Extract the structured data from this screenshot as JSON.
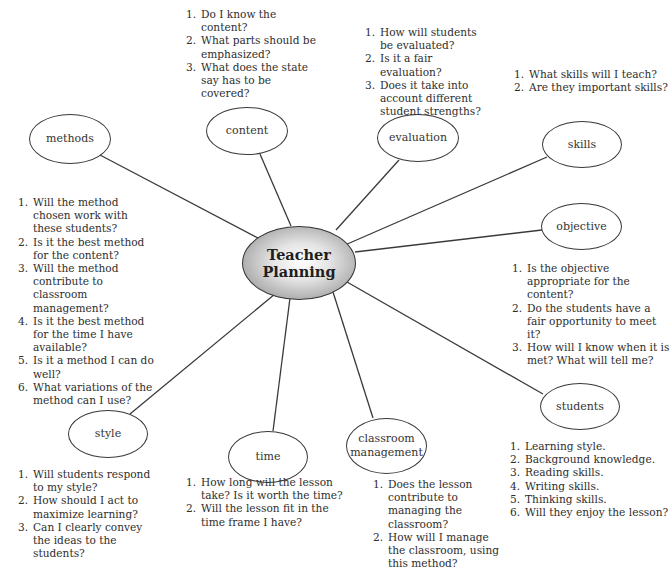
{
  "diagram": {
    "center": {
      "label_line1": "Teacher",
      "label_line2": "Planning"
    },
    "line_color": "#3a3a3a",
    "nodes": {
      "content": {
        "label": "content",
        "questions": [
          {
            "num": "1.",
            "text": "Do I know the content?"
          },
          {
            "num": "2.",
            "text": "What parts should be emphasized?"
          },
          {
            "num": "3.",
            "text": "What does the state say has to be covered?"
          }
        ]
      },
      "evaluation": {
        "label": "evaluation",
        "questions": [
          {
            "num": "1.",
            "text": "How will students be evaluated?"
          },
          {
            "num": "2.",
            "text": "Is it a fair evaluation?"
          },
          {
            "num": "3.",
            "text": "Does it take into account different student strengths?"
          }
        ]
      },
      "skills": {
        "label": "skills",
        "questions": [
          {
            "num": "1.",
            "text": "What skills will I teach?"
          },
          {
            "num": "2.",
            "text": "Are they important skills?"
          }
        ]
      },
      "methods": {
        "label": "methods",
        "questions": [
          {
            "num": "1.",
            "text": "Will the method chosen work with these students?"
          },
          {
            "num": "2.",
            "text": "Is it the best method for the content?"
          },
          {
            "num": "3.",
            "text": "Will the method contribute to classroom management?"
          },
          {
            "num": "4.",
            "text": "Is it the best method for the time I have available?"
          },
          {
            "num": "5.",
            "text": "Is it a method I can do well?"
          },
          {
            "num": "6.",
            "text": "What variations of the method can I use?"
          }
        ]
      },
      "objective": {
        "label": "objective",
        "questions": [
          {
            "num": "1.",
            "text": "Is the objective appropriate for the content?"
          },
          {
            "num": "2.",
            "text": "Do the students have a fair opportunity to meet it?"
          },
          {
            "num": "3.",
            "text": "How will I know when it is met? What will tell me?"
          }
        ]
      },
      "students": {
        "label": "students",
        "questions": [
          {
            "num": "1.",
            "text": "Learning style."
          },
          {
            "num": "2.",
            "text": "Background knowledge."
          },
          {
            "num": "3.",
            "text": "Reading skills."
          },
          {
            "num": "4.",
            "text": "Writing skills."
          },
          {
            "num": "5.",
            "text": "Thinking skills."
          },
          {
            "num": "6.",
            "text": "Will they enjoy the lesson?"
          }
        ]
      },
      "style": {
        "label": "style",
        "questions": [
          {
            "num": "1.",
            "text": "Will students respond to my style?"
          },
          {
            "num": "2.",
            "text": "How should I act to maximize learning?"
          },
          {
            "num": "3.",
            "text": "Can I clearly convey the ideas to the students?"
          }
        ]
      },
      "time": {
        "label": "time",
        "questions": [
          {
            "num": "1.",
            "text": "How long will the lesson take? Is it worth the time?"
          },
          {
            "num": "2.",
            "text": "Will the lesson fit in the time frame I have?"
          }
        ]
      },
      "classroom_management": {
        "label_line1": "classroom",
        "label_line2": "management",
        "questions": [
          {
            "num": "1.",
            "text": "Does the lesson contribute to managing the classroom?"
          },
          {
            "num": "2.",
            "text": "How will I manage the classroom, using this method?"
          }
        ]
      }
    }
  }
}
